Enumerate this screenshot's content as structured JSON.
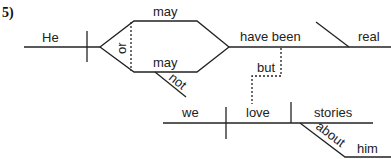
{
  "diagram": {
    "type": "sentence-diagram",
    "number_label": "5)",
    "main_clause": {
      "subject": "He",
      "compound_verb": {
        "conjunction": "or",
        "upper_verb": "may",
        "lower_verb": "may",
        "lower_modifier": "not"
      },
      "verb": "have been",
      "predicate_adjective": "real"
    },
    "connector": "but",
    "sub_clause": {
      "subject": "we",
      "verb": "love",
      "direct_object": "stories",
      "preposition": "about",
      "object_of_preposition": "him"
    }
  }
}
